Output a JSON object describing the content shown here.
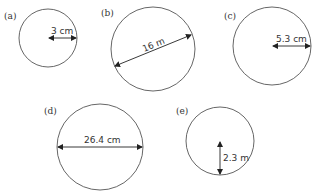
{
  "figures": [
    {
      "id": "a",
      "label": "(a)",
      "measure": "3 cm",
      "measure_type": "radius"
    },
    {
      "id": "b",
      "label": "(b)",
      "measure": "16 m",
      "measure_type": "diameter"
    },
    {
      "id": "c",
      "label": "(c)",
      "measure": "5.3 cm",
      "measure_type": "radius"
    },
    {
      "id": "d",
      "label": "(d)",
      "measure": "26.4 cm",
      "measure_type": "diameter"
    },
    {
      "id": "e",
      "label": "(e)",
      "measure": "2.3 m",
      "measure_type": "radius"
    }
  ],
  "colors": {
    "stroke": "#555555",
    "text": "#333333",
    "background": "#ffffff"
  }
}
